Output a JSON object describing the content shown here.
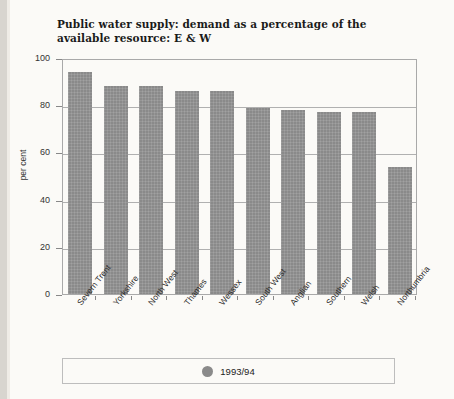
{
  "chart_data": {
    "type": "bar",
    "title": "Public water supply: demand as a percentage of the available resource: E & W",
    "xlabel": "",
    "ylabel": "per cent",
    "ylim": [
      0,
      100
    ],
    "yticks": [
      0,
      20,
      40,
      60,
      80,
      100
    ],
    "grid": true,
    "legend_position": "bottom",
    "categories": [
      "Severn Trent",
      "Yorkshire",
      "North West",
      "Thames",
      "Wessex",
      "South West",
      "Anglian",
      "Southern",
      "Welsh",
      "Northumbria"
    ],
    "series": [
      {
        "name": "1993/94",
        "color": "#8a8a8a",
        "values": [
          94,
          88,
          88,
          86,
          86,
          79,
          78,
          77,
          77,
          54
        ]
      }
    ]
  },
  "legend": {
    "items": [
      {
        "label": "1993/94",
        "marker": "circle",
        "color": "#8a8a8a"
      }
    ]
  },
  "axis": {
    "y_tick_labels": [
      "100",
      "80",
      "60",
      "40",
      "20",
      "0"
    ],
    "y_axis_title": "per cent"
  }
}
